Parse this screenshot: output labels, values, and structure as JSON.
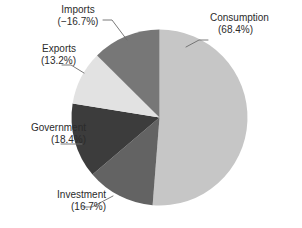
{
  "chart_data": {
    "type": "pie",
    "title": "",
    "subtitle": "",
    "xlabel": "",
    "ylabel": "",
    "legend_position": "callout-labels",
    "grid": false,
    "total_percent": 133.4,
    "categories": [
      "Consumption",
      "Investment",
      "Government",
      "Exports",
      "Imports"
    ],
    "values": [
      68.4,
      16.7,
      18.4,
      13.2,
      -16.7
    ],
    "slices": [
      {
        "name": "Consumption",
        "value": 68.4,
        "value_label": "(68.4%)",
        "magnitude": 68.4,
        "color": "#c6c6c6",
        "start_angle": 0,
        "end_angle": 184.5
      },
      {
        "name": "Investment",
        "value": 16.7,
        "value_label": "(16.7%)",
        "magnitude": 16.7,
        "color": "#636363",
        "start_angle": 184.5,
        "end_angle": 229.6
      },
      {
        "name": "Government",
        "value": 18.4,
        "value_label": "(18.4%)",
        "magnitude": 18.4,
        "color": "#3c3c3c",
        "start_angle": 229.6,
        "end_angle": 279.2
      },
      {
        "name": "Exports",
        "value": 13.2,
        "value_label": "(13.2%)",
        "magnitude": 13.2,
        "color": "#e2e2e2",
        "start_angle": 279.2,
        "end_angle": 314.8
      },
      {
        "name": "Imports",
        "value": -16.7,
        "value_label": "(−16.7%)",
        "magnitude": 16.7,
        "color": "#777777",
        "start_angle": 314.8,
        "end_angle": 360
      }
    ]
  },
  "labels": {
    "consumption": {
      "name": "Consumption",
      "value": "(68.4%)"
    },
    "imports": {
      "name": "Imports",
      "value": "(−16.7%)"
    },
    "exports": {
      "name": "Exports",
      "value": "(13.2%)"
    },
    "government": {
      "name": "Government",
      "value": "(18.4%)"
    },
    "investment": {
      "name": "Investment",
      "value": "(16.7%)"
    }
  },
  "caption": {
    "text": ""
  },
  "colors": {
    "background": "#ffffff",
    "text": "#2b2b2b",
    "leader_line": "#6b6b6b",
    "consumption": "#c6c6c6",
    "investment": "#636363",
    "government": "#3c3c3c",
    "exports": "#e2e2e2",
    "imports": "#777777"
  }
}
